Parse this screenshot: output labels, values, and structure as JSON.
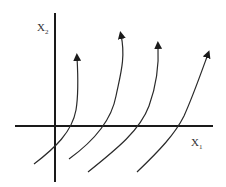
{
  "diagram": {
    "axes": {
      "x_label": "X",
      "x_subscript": "1",
      "y_label": "X",
      "y_subscript": "2"
    },
    "colors": {
      "axis": "#1a1a1a",
      "curve": "#2a2a2a",
      "background": "#ffffff"
    },
    "curves": [
      {
        "name": "trajectory-1",
        "direction": "up"
      },
      {
        "name": "trajectory-2",
        "direction": "up"
      },
      {
        "name": "trajectory-3",
        "direction": "up"
      },
      {
        "name": "trajectory-4",
        "direction": "up"
      }
    ]
  }
}
